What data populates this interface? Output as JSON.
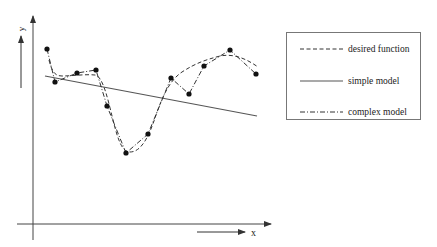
{
  "diagram": {
    "type": "model-fit-illustration",
    "axes": {
      "x_label": "x",
      "y_label": "y"
    },
    "legend": [
      {
        "label": "desired function",
        "style": "dashed"
      },
      {
        "label": "simple model",
        "style": "solid"
      },
      {
        "label": "complex model",
        "style": "dash-dot"
      }
    ],
    "data_points": [
      [
        47,
        49
      ],
      [
        55,
        82
      ],
      [
        77,
        73
      ],
      [
        96,
        70
      ],
      [
        107,
        106
      ],
      [
        126,
        153
      ],
      [
        148,
        134
      ],
      [
        171,
        78
      ],
      [
        189,
        94
      ],
      [
        204,
        66
      ],
      [
        230,
        50
      ],
      [
        256,
        74
      ]
    ],
    "colors": {
      "line": "#333333",
      "axis": "#444444",
      "legend_border": "#777777",
      "background": "#ffffff"
    }
  }
}
